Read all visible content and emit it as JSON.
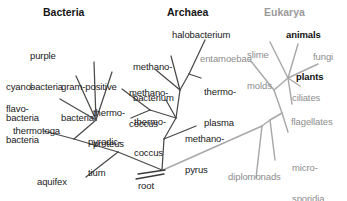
{
  "figure": {
    "kind": "unrooted-phylogenetic-tree",
    "background_color": "#ffffff",
    "colors": {
      "bacteria_line": "#4a4a4a",
      "archaea_line": "#4a4a4a",
      "eukarya_line": "#a0a0a0",
      "dark_text": "#1a1a1a",
      "gray_text": "#8d8d8d",
      "bold_text": "#111111",
      "header_gray": "#9a9a9a"
    }
  },
  "headers": [
    {
      "label": "Bacteria",
      "domain": "bacteria",
      "style": "dark"
    },
    {
      "label": "Archaea",
      "domain": "archaea",
      "style": "dark"
    },
    {
      "label": "Eukarya",
      "domain": "eukarya",
      "style": "gray"
    }
  ],
  "root": {
    "label": "root"
  },
  "bacteria": {
    "name": "Bacteria",
    "taxa": [
      {
        "label": "purple\nbacteria",
        "line1": "purple",
        "line2": "bacteria"
      },
      {
        "label": "cyano-\nbacteria",
        "line1": "cyano-",
        "line2": "bacteria"
      },
      {
        "label": "flavo-\nbacteria",
        "line1": "flavo-",
        "line2": "bacteria"
      },
      {
        "label": "gram-positive\nbacteria",
        "line1": "gram-positive",
        "line2": "bacteria"
      },
      {
        "label": "thermotoga"
      },
      {
        "label": "aquifex"
      }
    ]
  },
  "archaea": {
    "name": "Archaea",
    "taxa": [
      {
        "label": "halobacterium"
      },
      {
        "label": "methano-\nbacterium",
        "line1": "methano-",
        "line2": "bacterium"
      },
      {
        "label": "methano-\ncoccus",
        "line1": "methano-",
        "line2": "coccus"
      },
      {
        "label": "thermo-\nproteus",
        "line1": "thermo-",
        "line2": "proteus"
      },
      {
        "label": "pyrodic-\ntium",
        "line1": "pyrodic-",
        "line2": "tium"
      },
      {
        "label": "thermo-\ncoccus",
        "line1": "thermo-",
        "line2": "coccus"
      },
      {
        "label": "thermo-\nplasma",
        "line1": "thermo-",
        "line2": "plasma"
      },
      {
        "label": "methano-\npyrus",
        "line1": "methano-",
        "line2": "pyrus"
      }
    ]
  },
  "eukarya": {
    "name": "Eukarya",
    "taxa": [
      {
        "label": "entamoebae",
        "emphasis": "normal"
      },
      {
        "label": "slime\nmolds",
        "line1": "slime",
        "line2": "molds",
        "emphasis": "normal"
      },
      {
        "label": "animals",
        "emphasis": "bold"
      },
      {
        "label": "fungi",
        "emphasis": "normal"
      },
      {
        "label": "plants",
        "emphasis": "bold"
      },
      {
        "label": "ciliates",
        "emphasis": "normal"
      },
      {
        "label": "flagellates",
        "emphasis": "normal"
      },
      {
        "label": "micro-\nsporidia",
        "line1": "micro-",
        "line2": "sporidia",
        "emphasis": "normal"
      },
      {
        "label": "diplomonads",
        "emphasis": "normal"
      }
    ]
  }
}
